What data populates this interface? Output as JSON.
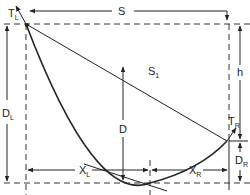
{
  "diagram": {
    "labels": {
      "span": "S",
      "chord": "S",
      "chord_sub": "1",
      "tension_left": "T",
      "tension_left_sub": "L",
      "tension_right": "T",
      "tension_right_sub": "R",
      "sag": "D",
      "sag_left": "D",
      "sag_left_sub": "L",
      "sag_right": "D",
      "sag_right_sub": "R",
      "height_diff": "h",
      "dist_left": "X",
      "dist_left_sub": "L",
      "dist_right": "X",
      "dist_right_sub": "R"
    },
    "colors": {
      "ink": "#222222",
      "background": "#ffffff"
    }
  }
}
